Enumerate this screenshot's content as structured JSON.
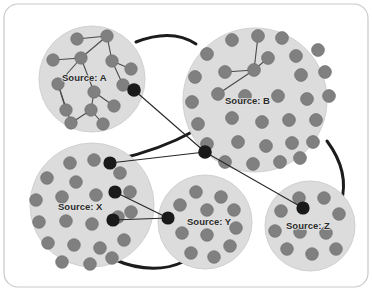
{
  "figure": {
    "type": "node-link-cluster-diagram",
    "frame": {
      "stroke": "#c9c9c9",
      "fill": "#ffffff",
      "corner_radius": 14,
      "x": 4,
      "y": 4,
      "width": 364,
      "height": 283
    },
    "palette": {
      "cluster_fill": "#dcdcdc",
      "cluster_stroke": "#d0d0d0",
      "node_fill": "#808080",
      "node_stroke": "#6f6f6f",
      "bridge_node_fill": "#1a1a1a",
      "intra_edge": "#4a4a4a",
      "inter_edge": "#262626",
      "arc_edge": "#1c1c1c",
      "label_text": "#2b2b2b"
    }
  },
  "clusters": [
    {
      "id": "A",
      "label": "Source: A",
      "cx": 92,
      "cy": 79,
      "r": 53,
      "label_x": 62,
      "label_y": 81,
      "node_radius": 6.2,
      "nodes": [
        {
          "x": 77,
          "y": 39
        },
        {
          "x": 107,
          "y": 36
        },
        {
          "x": 53,
          "y": 60
        },
        {
          "x": 81,
          "y": 58
        },
        {
          "x": 112,
          "y": 61
        },
        {
          "x": 131,
          "y": 69
        },
        {
          "x": 58,
          "y": 84
        },
        {
          "x": 94,
          "y": 92
        },
        {
          "x": 66,
          "y": 110
        },
        {
          "x": 91,
          "y": 110
        },
        {
          "x": 114,
          "y": 106
        },
        {
          "x": 103,
          "y": 124
        },
        {
          "x": 71,
          "y": 123
        },
        {
          "x": 123,
          "y": 85
        }
      ],
      "bridge_nodes": [
        {
          "x": 134,
          "y": 90,
          "r": 6.8
        }
      ],
      "edges": [
        [
          0,
          1
        ],
        [
          1,
          4
        ],
        [
          1,
          3
        ],
        [
          3,
          2
        ],
        [
          3,
          6
        ],
        [
          4,
          5
        ],
        [
          4,
          13
        ],
        [
          3,
          7
        ],
        [
          6,
          8
        ],
        [
          7,
          9
        ],
        [
          7,
          10
        ],
        [
          9,
          11
        ],
        [
          9,
          12
        ],
        [
          6,
          12
        ]
      ]
    },
    {
      "id": "B",
      "label": "Source: B",
      "cx": 255,
      "cy": 100,
      "r": 72,
      "label_x": 225,
      "label_y": 104,
      "node_radius": 6.4,
      "nodes": [
        {
          "x": 232,
          "y": 40
        },
        {
          "x": 258,
          "y": 36
        },
        {
          "x": 282,
          "y": 38
        },
        {
          "x": 207,
          "y": 54
        },
        {
          "x": 296,
          "y": 56
        },
        {
          "x": 318,
          "y": 50
        },
        {
          "x": 195,
          "y": 77
        },
        {
          "x": 225,
          "y": 72
        },
        {
          "x": 254,
          "y": 70
        },
        {
          "x": 268,
          "y": 58
        },
        {
          "x": 301,
          "y": 75
        },
        {
          "x": 325,
          "y": 72
        },
        {
          "x": 192,
          "y": 102
        },
        {
          "x": 218,
          "y": 94
        },
        {
          "x": 245,
          "y": 96
        },
        {
          "x": 278,
          "y": 96
        },
        {
          "x": 307,
          "y": 99
        },
        {
          "x": 329,
          "y": 96
        },
        {
          "x": 198,
          "y": 124
        },
        {
          "x": 232,
          "y": 118
        },
        {
          "x": 262,
          "y": 122
        },
        {
          "x": 289,
          "y": 120
        },
        {
          "x": 316,
          "y": 120
        },
        {
          "x": 207,
          "y": 144
        },
        {
          "x": 238,
          "y": 142
        },
        {
          "x": 266,
          "y": 146
        },
        {
          "x": 292,
          "y": 143
        },
        {
          "x": 313,
          "y": 142
        },
        {
          "x": 225,
          "y": 162
        },
        {
          "x": 253,
          "y": 164
        },
        {
          "x": 280,
          "y": 162
        },
        {
          "x": 300,
          "y": 158
        }
      ],
      "bridge_nodes": [
        {
          "x": 205,
          "y": 152,
          "r": 6.8
        }
      ],
      "edges": [
        [
          8,
          1
        ],
        [
          8,
          7
        ],
        [
          8,
          9
        ],
        [
          8,
          13
        ]
      ]
    },
    {
      "id": "X",
      "label": "Source: X",
      "cx": 92,
      "cy": 205,
      "r": 62,
      "label_x": 58,
      "label_y": 210,
      "node_radius": 6.3,
      "nodes": [
        {
          "x": 70,
          "y": 163
        },
        {
          "x": 94,
          "y": 160
        },
        {
          "x": 47,
          "y": 178
        },
        {
          "x": 76,
          "y": 182
        },
        {
          "x": 120,
          "y": 173
        },
        {
          "x": 36,
          "y": 200
        },
        {
          "x": 62,
          "y": 197
        },
        {
          "x": 96,
          "y": 195
        },
        {
          "x": 130,
          "y": 192
        },
        {
          "x": 39,
          "y": 222
        },
        {
          "x": 66,
          "y": 221
        },
        {
          "x": 92,
          "y": 224
        },
        {
          "x": 118,
          "y": 217
        },
        {
          "x": 131,
          "y": 212
        },
        {
          "x": 48,
          "y": 243
        },
        {
          "x": 74,
          "y": 245
        },
        {
          "x": 100,
          "y": 248
        },
        {
          "x": 124,
          "y": 240
        },
        {
          "x": 62,
          "y": 262
        },
        {
          "x": 90,
          "y": 264
        },
        {
          "x": 112,
          "y": 258
        }
      ],
      "bridge_nodes": [
        {
          "x": 110,
          "y": 163,
          "r": 6.6
        },
        {
          "x": 115,
          "y": 192,
          "r": 6.6
        },
        {
          "x": 113,
          "y": 220,
          "r": 6.6
        }
      ],
      "edges": []
    },
    {
      "id": "Y",
      "label": "Source: Y",
      "cx": 205,
      "cy": 222,
      "r": 47,
      "label_x": 187,
      "label_y": 225,
      "node_radius": 6.3,
      "nodes": [
        {
          "x": 196,
          "y": 192
        },
        {
          "x": 221,
          "y": 197
        },
        {
          "x": 180,
          "y": 205
        },
        {
          "x": 207,
          "y": 210
        },
        {
          "x": 234,
          "y": 210
        },
        {
          "x": 236,
          "y": 228
        },
        {
          "x": 182,
          "y": 233
        },
        {
          "x": 207,
          "y": 235
        },
        {
          "x": 230,
          "y": 246
        },
        {
          "x": 191,
          "y": 253
        },
        {
          "x": 214,
          "y": 257
        }
      ],
      "bridge_nodes": [
        {
          "x": 168,
          "y": 218,
          "r": 6.6
        }
      ],
      "edges": []
    },
    {
      "id": "Z",
      "label": "Source: Z",
      "cx": 310,
      "cy": 226,
      "r": 45,
      "label_x": 286,
      "label_y": 229,
      "node_radius": 6.3,
      "nodes": [
        {
          "x": 299,
          "y": 198
        },
        {
          "x": 324,
          "y": 198
        },
        {
          "x": 281,
          "y": 211
        },
        {
          "x": 339,
          "y": 214
        },
        {
          "x": 275,
          "y": 231
        },
        {
          "x": 300,
          "y": 232
        },
        {
          "x": 326,
          "y": 233
        },
        {
          "x": 287,
          "y": 249
        },
        {
          "x": 312,
          "y": 254
        },
        {
          "x": 336,
          "y": 249
        }
      ],
      "bridge_nodes": [
        {
          "x": 303,
          "y": 208,
          "r": 6.6
        }
      ],
      "edges": []
    }
  ],
  "inter_cluster_links": [
    {
      "from": "A",
      "to": "B",
      "style": "thin",
      "x1": 134,
      "y1": 90,
      "x2": 205,
      "y2": 152
    },
    {
      "from": "X",
      "to": "B",
      "style": "thin",
      "x1": 110,
      "y1": 163,
      "x2": 205,
      "y2": 152
    },
    {
      "from": "B",
      "to": "Z",
      "style": "thin",
      "x1": 205,
      "y1": 152,
      "x2": 303,
      "y2": 208
    },
    {
      "from": "X",
      "to": "Y",
      "style": "thin",
      "x1": 115,
      "y1": 192,
      "x2": 168,
      "y2": 218
    },
    {
      "from": "X",
      "to": "Y",
      "style": "thin",
      "x1": 113,
      "y1": 220,
      "x2": 168,
      "y2": 218
    }
  ],
  "cluster_arcs": [
    {
      "from": "A",
      "to": "B",
      "path": "M 136 42 Q 172 28 196 44",
      "width": 3.0
    },
    {
      "from": "X",
      "to": "B",
      "path": "M 115 160 Q 160 150 194 131",
      "width": 3.0
    },
    {
      "from": "B",
      "to": "Z",
      "path": "M 327 141 Q 350 172 341 203",
      "width": 3.0
    },
    {
      "from": "X",
      "to": "Y",
      "path": "M 113 259 Q 152 276 183 262",
      "width": 3.0
    }
  ]
}
